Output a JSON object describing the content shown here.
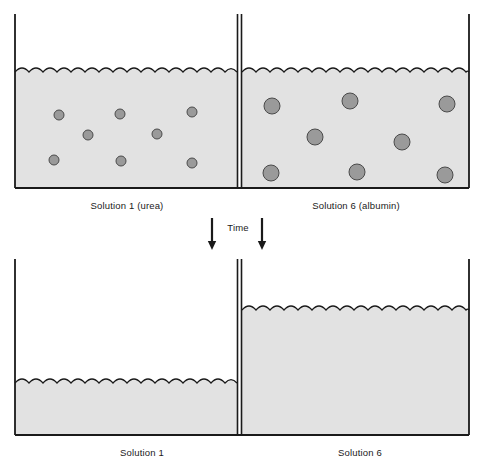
{
  "figure": {
    "background_color": "#ffffff",
    "line_color": "#1a1a1a",
    "fluid_fill": "#e2e2e2",
    "solute_fill": "#9a9a9a",
    "solute_stroke": "#4a4a4a"
  },
  "panels": [
    {
      "id": "before",
      "left_chamber": {
        "label": "Solution 1 (urea)",
        "fluid_level_y": 72,
        "particle_count": 8,
        "particle_radius": 5,
        "particles": [
          {
            "cx": 59,
            "cy": 115
          },
          {
            "cx": 120,
            "cy": 114
          },
          {
            "cx": 192,
            "cy": 112
          },
          {
            "cx": 88,
            "cy": 135
          },
          {
            "cx": 157,
            "cy": 134
          },
          {
            "cx": 54,
            "cy": 160
          },
          {
            "cx": 121,
            "cy": 161
          },
          {
            "cx": 192,
            "cy": 163
          }
        ]
      },
      "right_chamber": {
        "label": "Solution 6 (albumin)",
        "fluid_level_y": 72,
        "particle_count": 8,
        "particle_radius": 8,
        "particles": [
          {
            "cx": 272,
            "cy": 106
          },
          {
            "cx": 350,
            "cy": 101
          },
          {
            "cx": 447,
            "cy": 104
          },
          {
            "cx": 315,
            "cy": 137
          },
          {
            "cx": 402,
            "cy": 142
          },
          {
            "cx": 271,
            "cy": 173
          },
          {
            "cx": 357,
            "cy": 172
          },
          {
            "cx": 445,
            "cy": 175
          }
        ]
      }
    },
    {
      "id": "after",
      "left_chamber": {
        "label": "Solution 1",
        "fluid_level_y": 383,
        "particle_count": 0,
        "particles": []
      },
      "right_chamber": {
        "label": "Solution 6",
        "fluid_level_y": 310,
        "particle_count": 0,
        "particles": []
      }
    }
  ],
  "transition": {
    "label": "Time",
    "arrow_count": 2,
    "direction": "down",
    "left_arrow_x": 212,
    "right_arrow_x": 262,
    "label_x": 238,
    "label_y": 228
  },
  "geometry": {
    "outer_left_x": 15,
    "outer_right_x": 469,
    "membrane_x": 240,
    "top_panel_top_y": 14,
    "top_panel_bottom_y": 188,
    "bottom_panel_top_y": 259,
    "bottom_panel_bottom_y": 435,
    "caption_top_y": 205,
    "caption_bottom_y": 453,
    "wave_period": 14,
    "wave_amplitude": 4
  },
  "captions": {
    "top_left": "Solution 1 (urea)",
    "top_right": "Solution 6 (albumin)",
    "bottom_left": "Solution 1",
    "bottom_right": "Solution 6"
  }
}
